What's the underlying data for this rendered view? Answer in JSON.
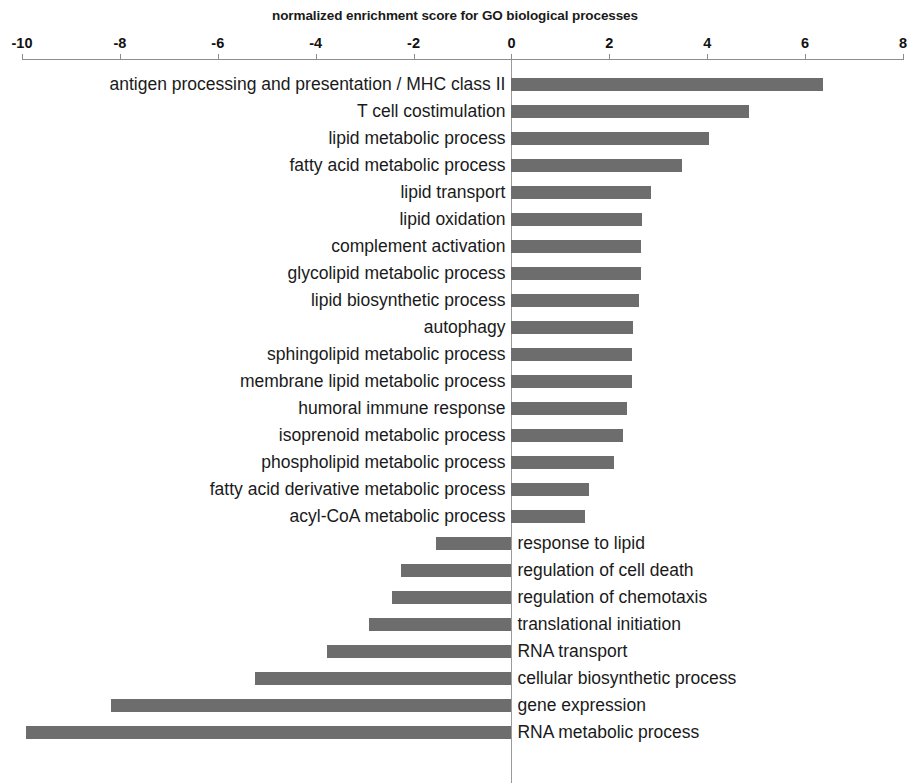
{
  "chart_data": {
    "type": "bar",
    "orientation": "horizontal",
    "title": "normalized enrichment score for GO biological processes",
    "xlabel": "normalized enrichment score for GO biological processes",
    "ylabel": "",
    "xlim": [
      -10,
      8
    ],
    "xticks": [
      -10,
      -8,
      -6,
      -4,
      -2,
      0,
      2,
      4,
      6,
      8
    ],
    "xtick_labels": [
      "-10",
      "-8",
      "-6",
      "-4",
      "-2",
      "0",
      "2",
      "4",
      "6",
      "8"
    ],
    "grid": false,
    "legend": null,
    "bar_color": "#6d6d6d",
    "axis_position": "top",
    "categories": [
      "antigen processing and presentation / MHC class II",
      "T cell costimulation",
      "lipid metabolic process",
      "fatty acid metabolic process",
      "lipid transport",
      "lipid oxidation",
      "complement activation",
      "glycolipid metabolic process",
      "lipid biosynthetic process",
      "autophagy",
      "sphingolipid metabolic process",
      "membrane lipid metabolic process",
      "humoral immune response",
      "isoprenoid metabolic process",
      "phospholipid metabolic process",
      "fatty acid derivative metabolic process",
      "acyl-CoA metabolic process",
      "response to lipid",
      "regulation of cell death",
      "regulation of chemotaxis",
      "translational initiation",
      "RNA transport",
      "cellular biosynthetic process",
      "gene expression",
      "RNA metabolic process"
    ],
    "values": [
      6.36,
      4.86,
      4.04,
      3.48,
      2.85,
      2.66,
      2.64,
      2.64,
      2.6,
      2.48,
      2.46,
      2.46,
      2.36,
      2.28,
      2.09,
      1.59,
      1.5,
      -1.55,
      -2.26,
      -2.44,
      -2.91,
      -3.76,
      -5.24,
      -8.19,
      -9.92
    ]
  }
}
